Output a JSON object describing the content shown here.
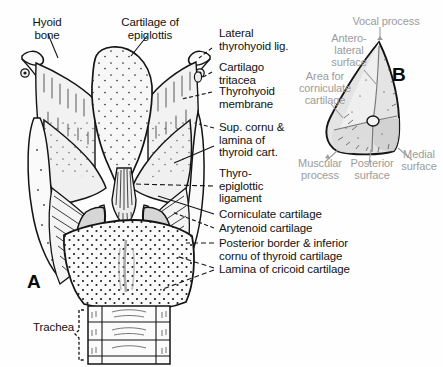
{
  "figure": {
    "background_color": "#fefefe",
    "ink_color": "#111111",
    "gray_label_color": "#9c9c9c",
    "cartilage_fill": "#f2f2f2",
    "arytenoid_fill": "#d8d8d8"
  },
  "panels": {
    "a": {
      "tag": "A",
      "caption": "Posterior view of larynx"
    },
    "b": {
      "tag": "B",
      "caption": "Arytenoid cartilage"
    }
  },
  "panel_a_labels": {
    "hyoid_bone": "Hyoid\nbone",
    "cartilage_of_epiglottis": "Cartilage of\nepiglottis",
    "lateral_thyrohyoid_lig": "Lateral\nthyrohyoid lig.",
    "cartilago_tritacea": "Cartilago\ntritacea",
    "thyrohyoid_membrane": "Thyrohyoid\nmembrane",
    "sup_cornu_lamina": "Sup. cornu &\nlamina of\nthyroid cart.",
    "thyroepiglottic_ligament": "Thyro-\nepiglottic\nligament",
    "corniculate_cartilage": "Corniculate cartilage",
    "arytenoid_cartilage": "Arytenoid cartilage",
    "posterior_border_inferior_cornu": "Posterior border & inferior\ncornu of thyroid cartilage",
    "lamina_of_cricoid_cartilage": "Lamina of cricoid cartilage",
    "trachea": "Trachea"
  },
  "panel_b_labels": {
    "vocal_process": "Vocal process",
    "antero_lateral_surface": "Antero-\nlateral\nsurface",
    "area_for_corniculate_cartilage": "Area for\ncorniculate\ncartilage",
    "muscular_process": "Muscular\nprocess",
    "posterior_surface": "Posterior\nsurface",
    "medial_surface": "Medial\nsurface"
  }
}
